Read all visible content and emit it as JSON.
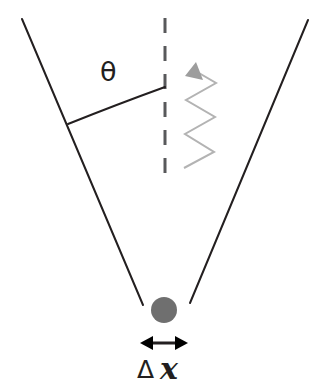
{
  "figure": {
    "name": "single-slit-diffraction-uncertainty-diagram",
    "background_color": "#ffffff",
    "width": 323,
    "height": 389
  },
  "labels": {
    "angle_symbol": "θ",
    "delta_symbol": "Δ",
    "x_symbol": "x"
  },
  "colors": {
    "line_color": "#231f20",
    "dashed_line_color": "#58595b",
    "particle_color": "#6f6f6f",
    "wave_color": "#b3b3b3",
    "arrow_color": "#231f20"
  },
  "elements": {
    "left_cone_line": {
      "name": "left-spread-line",
      "x1": 22,
      "y1": 19,
      "x2": 143,
      "y2": 305
    },
    "right_cone_line": {
      "name": "right-spread-line",
      "x1": 308,
      "y1": 20,
      "x2": 190,
      "y2": 303
    },
    "center_dashed_line": {
      "name": "center-axis-dashed-line",
      "x": 165,
      "y1": 18,
      "y2": 176,
      "dash_pattern": "15 13"
    },
    "angle_arc": {
      "name": "angle-arc",
      "path": "M 68 124 Q 118 104 165 87"
    },
    "wave_arrow": {
      "name": "zigzag-wave-arrow",
      "path": "M 184 168 L 214 152 L 185 134 L 215 117 L 186 100 L 216 83 L 190 68",
      "arrow_tip_x": 196,
      "arrow_tip_y": 62
    },
    "particle": {
      "name": "particle-dot",
      "cx": 164,
      "cy": 310,
      "r": 13
    },
    "measure_arrow": {
      "name": "delta-x-double-arrow",
      "x1": 141,
      "x2": 187,
      "y": 343
    }
  }
}
